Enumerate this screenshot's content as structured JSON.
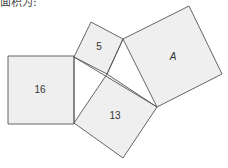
{
  "caption": "面积为:",
  "diagram": {
    "type": "pythagorean-squares",
    "colors": {
      "fill": "#efefef",
      "stroke": "#555555",
      "background": "#ffffff"
    },
    "squares": [
      {
        "id": "sq16",
        "label": "16",
        "points": "8,56 74,56 74,124 8,124",
        "label_pos": [
          40,
          90
        ],
        "italic": false
      },
      {
        "id": "sq5",
        "label": "5",
        "points": "91,22 123,39 107,74 74,57",
        "label_pos": [
          99,
          47
        ],
        "italic": false
      },
      {
        "id": "sq13",
        "label": "13",
        "points": "107,74 157,107 123,158 74,123",
        "label_pos": [
          115,
          116
        ],
        "italic": false
      },
      {
        "id": "sqA",
        "label": "A",
        "points": "189,6 222,74 157,107 123,39",
        "label_pos": [
          173,
          57
        ],
        "italic": true
      }
    ]
  }
}
